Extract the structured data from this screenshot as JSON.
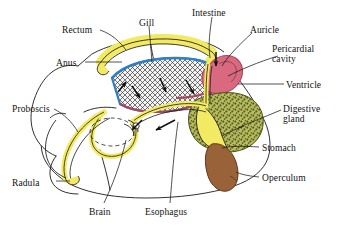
{
  "figure": {
    "background": "#ffffff",
    "width": 342,
    "height": 232
  },
  "colors": {
    "ink": "#1a1a1a",
    "yellow": "#f2ea63",
    "yellow_dark": "#cdc23a",
    "blue": "#2f7fc4",
    "pink": "#d9697f",
    "pink_dark": "#a8465c",
    "olive": "#9aa03f",
    "olive_speck": "#5a5f20",
    "brown": "#9a6239",
    "brown_dark": "#6d4326",
    "gill_fill": "#f4f4f4",
    "gill_hatch": "#3a3a3a",
    "leader": "#1a1a1a"
  },
  "labels": [
    {
      "id": "rectum",
      "text": "Rectum",
      "x": 62,
      "y": 25,
      "align": "left"
    },
    {
      "id": "gill",
      "text": "Gill",
      "x": 139,
      "y": 18,
      "align": "left"
    },
    {
      "id": "intestine",
      "text": "Intestine",
      "x": 192,
      "y": 8,
      "align": "left"
    },
    {
      "id": "auricle",
      "text": "Auricle",
      "x": 250,
      "y": 25,
      "align": "left"
    },
    {
      "id": "pericardial",
      "text": "Pericardial\ncavity",
      "x": 272,
      "y": 44,
      "align": "left"
    },
    {
      "id": "ventricle",
      "text": "Ventricle",
      "x": 286,
      "y": 80,
      "align": "left"
    },
    {
      "id": "digestive-gland",
      "text": "Digestive\ngland",
      "x": 283,
      "y": 104,
      "align": "left"
    },
    {
      "id": "stomach",
      "text": "Stomach",
      "x": 262,
      "y": 143,
      "align": "left"
    },
    {
      "id": "operculum",
      "text": "Operculum",
      "x": 262,
      "y": 173,
      "align": "left"
    },
    {
      "id": "anus",
      "text": "Anus",
      "x": 56,
      "y": 58,
      "align": "left"
    },
    {
      "id": "proboscis",
      "text": "Proboscis",
      "x": 12,
      "y": 104,
      "align": "left"
    },
    {
      "id": "radula",
      "text": "Radula",
      "x": 12,
      "y": 178,
      "align": "left"
    },
    {
      "id": "brain",
      "text": "Brain",
      "x": 89,
      "y": 207,
      "align": "left"
    },
    {
      "id": "esophagus",
      "text": "Esophagus",
      "x": 145,
      "y": 207,
      "align": "left"
    }
  ],
  "structures": [
    {
      "id": "rectum",
      "label": "Rectum",
      "color": "#f2ea63",
      "note": "yellow arched band over mantle cavity"
    },
    {
      "id": "gill",
      "label": "Gill",
      "color": "#f4f4f4",
      "note": "cross-hatched ctenidium with blue afferent vessel"
    },
    {
      "id": "intestine",
      "label": "Intestine",
      "color": "#f2ea63",
      "note": "yellow tube rising to rectum"
    },
    {
      "id": "auricle",
      "label": "Auricle",
      "color": "#d9697f",
      "note": "pink upper heart chamber"
    },
    {
      "id": "pericardial-cavity",
      "label": "Pericardial cavity",
      "color": "#d9697f",
      "note": "space enclosing the heart"
    },
    {
      "id": "ventricle",
      "label": "Ventricle",
      "color": "#d9697f",
      "note": "pink lower heart chamber"
    },
    {
      "id": "digestive-gland",
      "label": "Digestive gland",
      "color": "#9aa03f",
      "note": "olive speckled mass"
    },
    {
      "id": "stomach",
      "label": "Stomach",
      "color": "#f2ea63",
      "note": "yellow sac within digestive gland"
    },
    {
      "id": "operculum",
      "label": "Operculum",
      "color": "#9a6239",
      "note": "brown horny plate"
    },
    {
      "id": "anus",
      "label": "Anus",
      "color": "#f2ea63",
      "note": "terminal opening of rectum"
    },
    {
      "id": "proboscis",
      "label": "Proboscis",
      "color": "#ffffff",
      "note": "extensible snout at left"
    },
    {
      "id": "radula",
      "label": "Radula",
      "color": "#f2ea63",
      "note": "yellow rasping ribbon in proboscis"
    },
    {
      "id": "brain",
      "label": "Brain",
      "color": "#ffffff",
      "note": "nerve ring around esophagus"
    },
    {
      "id": "esophagus",
      "label": "Esophagus",
      "color": "#f2ea63",
      "note": "yellow tube to stomach"
    }
  ],
  "flow_arrows": {
    "count": 7,
    "note": "black arrows showing water current through mantle cavity and gut flow"
  }
}
